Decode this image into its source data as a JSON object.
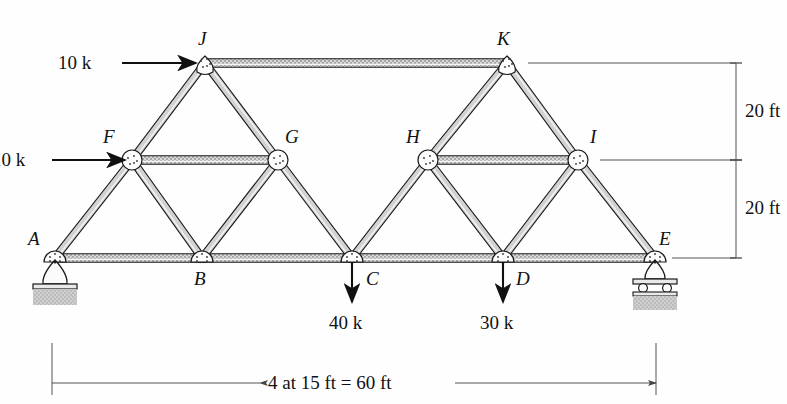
{
  "figure": {
    "type": "truss-diagram",
    "title": "",
    "units": "ft / kips"
  },
  "colors": {
    "member_fill": "#d2d2d2",
    "member_edge": "#1a1a1a",
    "chord_hatch": "#b6b6b6",
    "ground_hatch": "#c9c9c9",
    "line": "#111111",
    "dim_line": "#555555",
    "gusset_fill": "#fdfdfd"
  },
  "geometry": {
    "span_ft": 60,
    "panel_ft": 15,
    "panels": 4,
    "lower_chord_y_ft": 0,
    "mid_chord_y_ft": 20,
    "top_chord_y_ft": 40
  },
  "joints": [
    {
      "id": "A",
      "label": "A",
      "x": 55,
      "y": 258,
      "label_x": 28,
      "label_y": 228,
      "level": "bottom"
    },
    {
      "id": "B",
      "label": "B",
      "x": 202,
      "y": 258,
      "label_x": 194,
      "label_y": 268,
      "level": "bottom"
    },
    {
      "id": "C",
      "label": "C",
      "x": 352,
      "y": 258,
      "label_x": 366,
      "label_y": 268,
      "level": "bottom"
    },
    {
      "id": "D",
      "label": "D",
      "x": 503,
      "y": 258,
      "label_x": 516,
      "label_y": 268,
      "level": "bottom"
    },
    {
      "id": "E",
      "label": "E",
      "x": 655,
      "y": 258,
      "label_x": 659,
      "label_y": 228,
      "level": "bottom"
    },
    {
      "id": "F",
      "label": "F",
      "x": 132,
      "y": 160,
      "label_x": 103,
      "label_y": 126,
      "level": "mid"
    },
    {
      "id": "G",
      "label": "G",
      "x": 278,
      "y": 160,
      "label_x": 285,
      "label_y": 126,
      "level": "mid"
    },
    {
      "id": "H",
      "label": "H",
      "x": 428,
      "y": 160,
      "label_x": 406,
      "label_y": 126,
      "level": "mid"
    },
    {
      "id": "I",
      "label": "I",
      "x": 578,
      "y": 160,
      "label_x": 590,
      "label_y": 126,
      "level": "mid"
    },
    {
      "id": "J",
      "label": "J",
      "x": 205,
      "y": 63,
      "label_x": 198,
      "label_y": 28,
      "level": "top"
    },
    {
      "id": "K",
      "label": "K",
      "x": 507,
      "y": 63,
      "label_x": 497,
      "label_y": 28,
      "level": "top"
    }
  ],
  "members": [
    {
      "from": "A",
      "to": "B",
      "kind": "chord"
    },
    {
      "from": "B",
      "to": "C",
      "kind": "chord"
    },
    {
      "from": "C",
      "to": "D",
      "kind": "chord"
    },
    {
      "from": "D",
      "to": "E",
      "kind": "chord"
    },
    {
      "from": "F",
      "to": "G",
      "kind": "chord"
    },
    {
      "from": "H",
      "to": "I",
      "kind": "chord"
    },
    {
      "from": "J",
      "to": "K",
      "kind": "chord"
    },
    {
      "from": "A",
      "to": "F",
      "kind": "diagonal"
    },
    {
      "from": "F",
      "to": "J",
      "kind": "diagonal"
    },
    {
      "from": "F",
      "to": "B",
      "kind": "diagonal"
    },
    {
      "from": "B",
      "to": "G",
      "kind": "diagonal"
    },
    {
      "from": "G",
      "to": "J",
      "kind": "diagonal"
    },
    {
      "from": "G",
      "to": "C",
      "kind": "diagonal"
    },
    {
      "from": "C",
      "to": "H",
      "kind": "diagonal"
    },
    {
      "from": "H",
      "to": "K",
      "kind": "diagonal"
    },
    {
      "from": "H",
      "to": "D",
      "kind": "diagonal"
    },
    {
      "from": "D",
      "to": "I",
      "kind": "diagonal"
    },
    {
      "from": "I",
      "to": "K",
      "kind": "diagonal"
    },
    {
      "from": "I",
      "to": "E",
      "kind": "diagonal"
    }
  ],
  "loads": [
    {
      "id": "load-j",
      "text": "10 k",
      "magnitude": 10,
      "unit": "k",
      "direction": "right",
      "at_joint": "J",
      "arrow_x1": 122,
      "arrow_x2": 196,
      "arrow_y": 63,
      "label_x": 58,
      "label_y": 52
    },
    {
      "id": "load-f",
      "text": "10 k",
      "magnitude": 10,
      "unit": "k",
      "direction": "right",
      "at_joint": "F",
      "arrow_x1": 52,
      "arrow_x2": 125,
      "arrow_y": 160,
      "label_x": 0,
      "label_y": 149
    },
    {
      "id": "load-c",
      "text": "40 k",
      "magnitude": 40,
      "unit": "k",
      "direction": "down",
      "at_joint": "C",
      "arrow_x": 352,
      "arrow_y1": 262,
      "arrow_y2": 302,
      "label_x": 329,
      "label_y": 312
    },
    {
      "id": "load-d",
      "text": "30 k",
      "magnitude": 30,
      "unit": "k",
      "direction": "down",
      "at_joint": "D",
      "arrow_x": 503,
      "arrow_y1": 262,
      "arrow_y2": 302,
      "label_x": 480,
      "label_y": 312
    }
  ],
  "dimensions": {
    "horizontal": {
      "text": "4 at 15 ft = 60 ft",
      "x1": 52,
      "x2": 656,
      "y": 383,
      "label_x": 268,
      "label_y": 372
    },
    "vertical": [
      {
        "id": "dim-upper",
        "text": "20 ft",
        "y1": 63,
        "y2": 160,
        "x": 736,
        "label_x": 745,
        "label_y": 100
      },
      {
        "id": "dim-lower",
        "text": "20 ft",
        "y1": 160,
        "y2": 258,
        "x": 736,
        "label_x": 745,
        "label_y": 197
      }
    ]
  },
  "supports": [
    {
      "id": "support-a",
      "type": "pin",
      "at_joint": "A",
      "x": 55,
      "y": 258
    },
    {
      "id": "support-e",
      "type": "roller",
      "at_joint": "E",
      "x": 655,
      "y": 258
    }
  ]
}
